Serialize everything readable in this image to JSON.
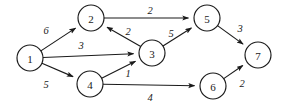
{
  "figure": {
    "title": "",
    "background": "#ffffff",
    "stroke_color": "#1a1a1a",
    "width": 284,
    "height": 111
  },
  "chart_data": {
    "type": "diagram",
    "diagram_kind": "directed-weighted-graph",
    "title": "",
    "xlabel": "",
    "ylabel": "",
    "grid": false,
    "legend": null,
    "directed": true,
    "node_radius": 13,
    "nodes": [
      {
        "id": "1",
        "label": "1",
        "x": 30,
        "y": 58
      },
      {
        "id": "2",
        "label": "2",
        "x": 91,
        "y": 18
      },
      {
        "id": "3",
        "label": "3",
        "x": 152,
        "y": 53
      },
      {
        "id": "4",
        "label": "4",
        "x": 90,
        "y": 84
      },
      {
        "id": "5",
        "label": "5",
        "x": 207,
        "y": 18
      },
      {
        "id": "6",
        "label": "6",
        "x": 213,
        "y": 86
      },
      {
        "id": "7",
        "label": "7",
        "x": 258,
        "y": 55
      }
    ],
    "edges": [
      {
        "from": "1",
        "to": "2",
        "weight": "6",
        "label_x": 46,
        "label_y": 30
      },
      {
        "from": "1",
        "to": "3",
        "weight": "3",
        "label_x": 81,
        "label_y": 45
      },
      {
        "from": "1",
        "to": "4",
        "weight": "5",
        "label_x": 46,
        "label_y": 84
      },
      {
        "from": "2",
        "to": "5",
        "weight": "2",
        "label_x": 150,
        "label_y": 10
      },
      {
        "from": "3",
        "to": "2",
        "weight": "2",
        "label_x": 128,
        "label_y": 31
      },
      {
        "from": "3",
        "to": "5",
        "weight": "5",
        "label_x": 171,
        "label_y": 33
      },
      {
        "from": "4",
        "to": "3",
        "weight": "1",
        "label_x": 128,
        "label_y": 73
      },
      {
        "from": "4",
        "to": "6",
        "weight": "4",
        "label_x": 150,
        "label_y": 97
      },
      {
        "from": "5",
        "to": "7",
        "weight": "3",
        "label_x": 240,
        "label_y": 28
      },
      {
        "from": "6",
        "to": "7",
        "weight": "2",
        "label_x": 242,
        "label_y": 83
      }
    ]
  }
}
